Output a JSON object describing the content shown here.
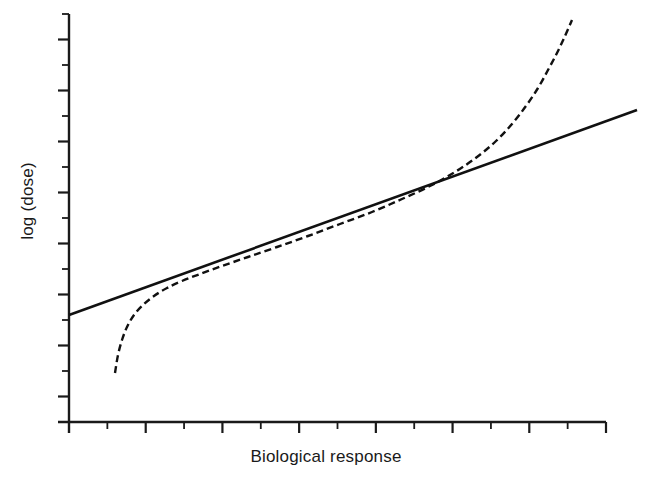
{
  "chart_data": {
    "type": "line",
    "title": "",
    "xlabel": "Biological response",
    "ylabel": "log (dose)",
    "grid": false,
    "legend": "none",
    "axis": {
      "x_range_px": [
        69,
        606
      ],
      "y_range_px": [
        422,
        14
      ],
      "x_tick_count": 14,
      "y_tick_count": 16,
      "tick_style": "alternating major and minor, unlabeled",
      "tick_labels_x": [],
      "tick_labels_y": []
    },
    "series": [
      {
        "name": "linear calibration line",
        "style": "solid",
        "color": "#111111",
        "width": 2.6,
        "points": [
          [
            69,
            315
          ],
          [
            637,
            110
          ]
        ]
      },
      {
        "name": "logistic dose-response curve",
        "style": "dashed",
        "color": "#111111",
        "width": 2.4,
        "dash": "7 4",
        "points": [
          [
            115,
            373
          ],
          [
            118,
            355
          ],
          [
            122,
            340
          ],
          [
            127,
            327
          ],
          [
            134,
            315
          ],
          [
            143,
            305
          ],
          [
            154,
            296
          ],
          [
            167,
            288
          ],
          [
            182,
            281
          ],
          [
            200,
            274
          ],
          [
            222,
            266
          ],
          [
            248,
            257
          ],
          [
            277,
            247
          ],
          [
            308,
            236
          ],
          [
            340,
            224
          ],
          [
            372,
            212
          ],
          [
            402,
            199
          ],
          [
            430,
            186
          ],
          [
            455,
            172
          ],
          [
            477,
            157
          ],
          [
            496,
            141
          ],
          [
            512,
            124
          ],
          [
            526,
            106
          ],
          [
            538,
            88
          ],
          [
            548,
            70
          ],
          [
            557,
            53
          ],
          [
            565,
            36
          ],
          [
            572,
            20
          ]
        ]
      }
    ],
    "annotations": []
  },
  "page": {
    "background_color": "#ffffff",
    "foreground_color": "#1a1a1a"
  }
}
